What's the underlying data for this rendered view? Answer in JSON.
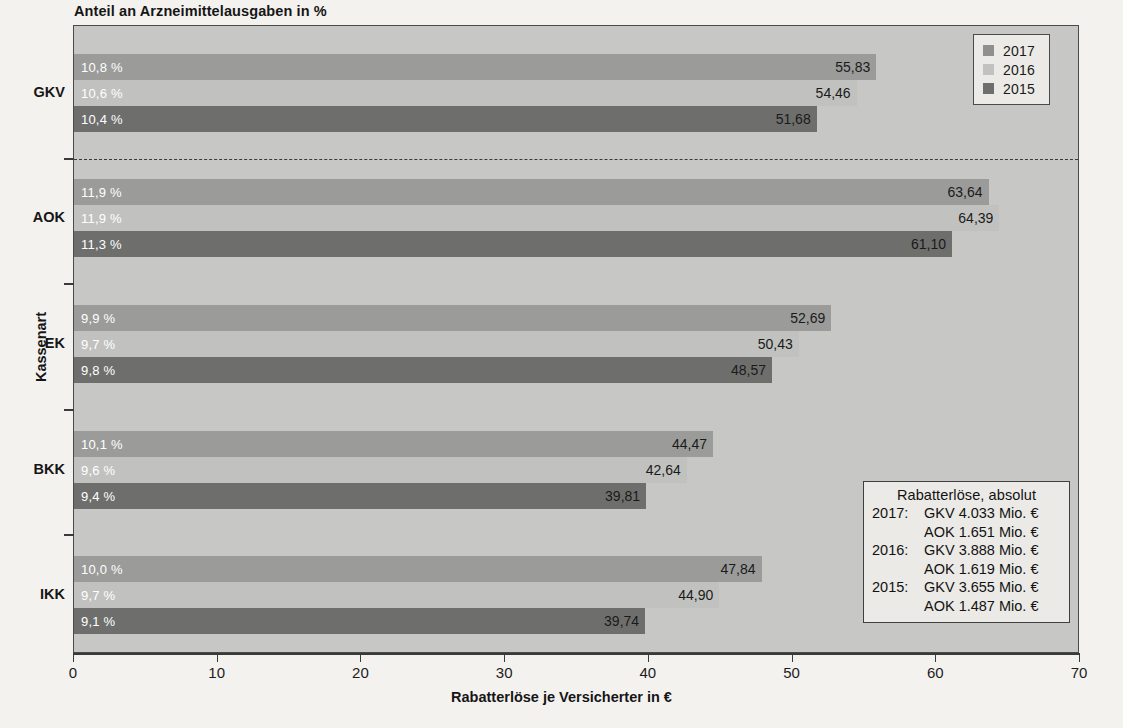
{
  "chart_data": {
    "type": "bar",
    "orientation": "horizontal",
    "title": "Anteil an Arzneimittelausgaben in %",
    "xlabel": "Rabatterlöse je Versicherter in €",
    "ylabel": "Kassenart",
    "xlim": [
      0,
      70
    ],
    "xticks": [
      0,
      10,
      20,
      30,
      40,
      50,
      60,
      70
    ],
    "xtick_labels": [
      "0",
      "10",
      "20",
      "30",
      "40",
      "50",
      "60",
      "70"
    ],
    "grid": false,
    "legend_position": "top-right",
    "categories": [
      "GKV",
      "AOK",
      "EK",
      "BKK",
      "IKK"
    ],
    "series": [
      {
        "name": "2017",
        "color": "#9b9c9a",
        "values": [
          55.83,
          63.64,
          52.69,
          44.47,
          47.84
        ],
        "value_labels": [
          "55,83",
          "63,64",
          "52,69",
          "44,47",
          "47,84"
        ],
        "share_labels": [
          "10,8 %",
          "11,9 %",
          "9,9 %",
          "10,1 %",
          "10,0 %"
        ]
      },
      {
        "name": "2016",
        "color": "#c1c2c0",
        "values": [
          54.46,
          64.39,
          50.43,
          42.64,
          44.9
        ],
        "value_labels": [
          "54,46",
          "64,39",
          "50,43",
          "42,64",
          "44,90"
        ],
        "share_labels": [
          "10,6 %",
          "11,9 %",
          "9,7 %",
          "9,6 %",
          "9,7 %"
        ]
      },
      {
        "name": "2015",
        "color": "#6e6f6d",
        "values": [
          51.68,
          61.1,
          48.57,
          39.81,
          39.74
        ],
        "value_labels": [
          "51,68",
          "61,10",
          "48,57",
          "39,81",
          "39,74"
        ],
        "share_labels": [
          "10,4 %",
          "11,3 %",
          "9,8 %",
          "9,4 %",
          "9,1 %"
        ]
      }
    ],
    "annotation": {
      "title": "Rabatterlöse, absolut",
      "lines": [
        {
          "year": "2017:",
          "text": "GKV 4.033 Mio. €"
        },
        {
          "year": "",
          "text": "AOK 1.651 Mio. €"
        },
        {
          "year": "2016:",
          "text": "GKV 3.888 Mio. €"
        },
        {
          "year": "",
          "text": "AOK 1.619 Mio. €"
        },
        {
          "year": "2015:",
          "text": "GKV 3.655 Mio. €"
        },
        {
          "year": "",
          "text": "AOK 1.487 Mio. €"
        }
      ]
    }
  },
  "legend": {
    "items": [
      {
        "label": "2017",
        "color": "#8f908e"
      },
      {
        "label": "2016",
        "color": "#c1c2c0"
      },
      {
        "label": "2015",
        "color": "#6e6f6d"
      }
    ]
  },
  "colors": {
    "plot_background": "#c7c8c6",
    "frame": "#4a4a4a",
    "series_2017": "#9b9c9a",
    "series_2016": "#c1c2c0",
    "series_2015": "#6e6f6d",
    "value_label": "#1a1a1a",
    "share_label": "#ffffff"
  }
}
